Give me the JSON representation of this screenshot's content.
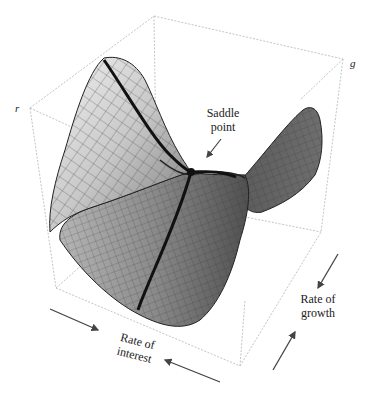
{
  "figure": {
    "type": "3d-surface-diagram"
  },
  "axes": {
    "vertical_label": "r",
    "depth_label": "g"
  },
  "annotations": {
    "saddle_label_line1": "Saddle",
    "saddle_label_line2": "point",
    "interest_line1": "Rate of",
    "interest_line2": "interest",
    "growth_line1": "Rate of",
    "growth_line2": "growth"
  },
  "colors": {
    "box_edge": "#b8b8b8",
    "surface_light": "#e6e6e6",
    "surface_mid": "#9a9a9a",
    "surface_dark": "#4a4a4a",
    "mesh": "#555555",
    "thick_curve": "#111111",
    "arrow": "#444444"
  }
}
